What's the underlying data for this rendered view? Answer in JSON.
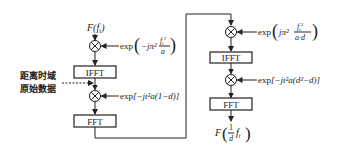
{
  "diagram": {
    "left_chain": {
      "input_label": "F(f_t)",
      "input_label_main": "F(",
      "input_label_var": "f",
      "input_label_sub": "t",
      "input_label_close": ")",
      "multiplier1_factor": {
        "prefix": "exp",
        "body": "−jπ²",
        "frac_num": "f_t²",
        "frac_num_var": "f",
        "frac_num_sub": "t",
        "frac_num_sup": "2",
        "frac_den": "a"
      },
      "ifft_label": "IFFT",
      "side_input_line1": "距离时域",
      "side_input_line2": "原始数据",
      "multiplier2_factor": "exp[−jt²a(1−d)]",
      "multiplier2_prefix": "exp",
      "multiplier2_body": "[−jt²a(1−d)]",
      "fft_label": "FFT"
    },
    "right_chain": {
      "multiplier1_factor": {
        "prefix": "exp",
        "body": "jπ²",
        "frac_num": "f_t²",
        "frac_num_var": "f",
        "frac_num_sub": "t",
        "frac_num_sup": "2",
        "frac_den": "a·d"
      },
      "ifft_label": "IFFT",
      "multiplier2_factor": "exp[−jt²a(d²−d)]",
      "multiplier2_prefix": "exp",
      "multiplier2_body": "[−jt²a(d²−d)]",
      "fft_label": "FFT",
      "output_label": "F((1/d) f_t)",
      "output_main": "F",
      "output_frac_num": "1",
      "output_frac_den": "d",
      "output_var": "f",
      "output_sub": "t"
    }
  }
}
